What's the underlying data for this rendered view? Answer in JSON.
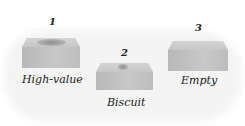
{
  "items": [
    {
      "number": "1",
      "label": "High-value",
      "content": "filled"
    },
    {
      "number": "2",
      "label": "Biscuit",
      "content": "partial"
    },
    {
      "number": "3",
      "label": "Empty",
      "content": "empty"
    }
  ],
  "colors": {
    "box_front": "#c0c0c0",
    "box_top": "#d0d0d0",
    "text": "#222222"
  }
}
